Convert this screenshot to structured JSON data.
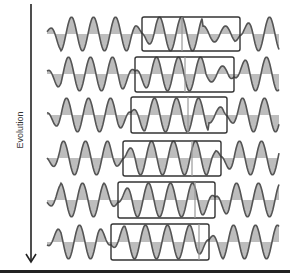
{
  "diagram": {
    "axis_label": "Evolution",
    "arrow": {
      "x": 31,
      "y_start": 4,
      "y_end": 262
    },
    "colors": {
      "wave": "#555555",
      "fill": "#bdbdbd",
      "box": "#333333",
      "marker": "#999999",
      "arrow": "#222222",
      "bottom_bar": "#222222"
    },
    "wave_x_start": 47,
    "wave_x_end": 279,
    "period": 22,
    "rows": [
      {
        "baseline": 34,
        "box": {
          "x1": 142,
          "x2": 240,
          "y1": 17,
          "y2": 51
        },
        "marker_x": 182,
        "phase": 0
      },
      {
        "baseline": 74,
        "box": {
          "x1": 135,
          "x2": 234,
          "y1": 57,
          "y2": 92
        },
        "marker_x": 185,
        "phase": 3
      },
      {
        "baseline": 115,
        "box": {
          "x1": 131,
          "x2": 227,
          "y1": 97,
          "y2": 133
        },
        "marker_x": 188,
        "phase": 5
      },
      {
        "baseline": 158,
        "box": {
          "x1": 123,
          "x2": 221,
          "y1": 141,
          "y2": 176
        },
        "marker_x": 192,
        "phase": 8
      },
      {
        "baseline": 200,
        "box": {
          "x1": 118,
          "x2": 215,
          "y1": 182,
          "y2": 218
        },
        "marker_x": 195,
        "phase": 11
      },
      {
        "baseline": 242,
        "box": {
          "x1": 111,
          "x2": 209,
          "y1": 224,
          "y2": 260
        },
        "marker_x": 199,
        "phase": 14
      }
    ]
  }
}
